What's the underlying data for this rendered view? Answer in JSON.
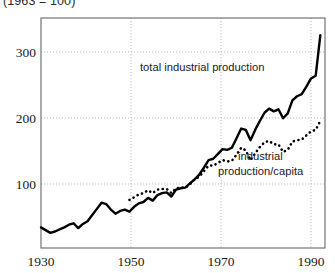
{
  "figure": {
    "title": "(1963 = 100)",
    "background_color": "#ffffff",
    "frame_color": "#555555",
    "grid_color": "#bdbdbd"
  },
  "axes": {
    "y_ticks": [
      "100",
      "200",
      "300"
    ],
    "x_ticks": [
      "1930",
      "1950",
      "1970",
      "1990"
    ]
  },
  "annotations": {
    "total": "total industrial production",
    "percapita_line1": "industrial",
    "percapita_line2": "production/capita"
  },
  "chart_data": {
    "type": "line",
    "title": "(1963 = 100)",
    "xlabel": "",
    "ylabel": "",
    "xlim": [
      1930,
      1991
    ],
    "ylim": [
      0,
      335
    ],
    "yticks": [
      100,
      200,
      300
    ],
    "xticks": [
      1930,
      1950,
      1970,
      1990
    ],
    "grid": true,
    "legend": "inline-annotations",
    "series": [
      {
        "name": "total industrial production",
        "style": "solid",
        "color": "#000000",
        "x": [
          1930,
          1931,
          1932,
          1933,
          1934,
          1935,
          1936,
          1937,
          1938,
          1939,
          1940,
          1941,
          1942,
          1943,
          1944,
          1945,
          1946,
          1947,
          1948,
          1949,
          1950,
          1951,
          1952,
          1953,
          1954,
          1955,
          1956,
          1957,
          1958,
          1959,
          1960,
          1961,
          1962,
          1963,
          1964,
          1965,
          1966,
          1967,
          1968,
          1969,
          1970,
          1971,
          1972,
          1973,
          1974,
          1975,
          1976,
          1977,
          1978,
          1979,
          1980,
          1981,
          1982,
          1983,
          1984,
          1985,
          1986,
          1987,
          1988,
          1989,
          1990
        ],
        "values": [
          30,
          26,
          22,
          24,
          27,
          30,
          34,
          36,
          29,
          35,
          39,
          48,
          57,
          66,
          64,
          56,
          50,
          54,
          56,
          53,
          60,
          65,
          67,
          73,
          69,
          77,
          80,
          81,
          75,
          85,
          87,
          88,
          94,
          100,
          107,
          117,
          128,
          130,
          137,
          144,
          143,
          146,
          160,
          174,
          172,
          157,
          172,
          185,
          197,
          203,
          199,
          202,
          189,
          196,
          215,
          221,
          224,
          235,
          247,
          251,
          310
        ],
        "note": "index 1963 = 100; rises sharply after 1960 with dips in 1975 and 1982"
      },
      {
        "name": "industrial production/capita",
        "style": "dotted",
        "color": "#000000",
        "x": [
          1949,
          1950,
          1951,
          1952,
          1953,
          1954,
          1955,
          1956,
          1957,
          1958,
          1959,
          1960,
          1961,
          1962,
          1963,
          1964,
          1965,
          1966,
          1967,
          1968,
          1969,
          1970,
          1971,
          1972,
          1973,
          1974,
          1975,
          1976,
          1977,
          1978,
          1979,
          1980,
          1981,
          1982,
          1983,
          1984,
          1985,
          1986,
          1987,
          1988,
          1989,
          1990
        ],
        "values": [
          70,
          74,
          78,
          80,
          84,
          80,
          85,
          86,
          86,
          80,
          87,
          88,
          88,
          93,
          100,
          104,
          112,
          120,
          120,
          124,
          128,
          126,
          127,
          136,
          146,
          142,
          128,
          138,
          147,
          154,
          156,
          151,
          151,
          140,
          143,
          155,
          157,
          158,
          164,
          170,
          172,
          185
        ],
        "note": "per-capita index; converges with total index at 100 in 1963"
      }
    ]
  }
}
